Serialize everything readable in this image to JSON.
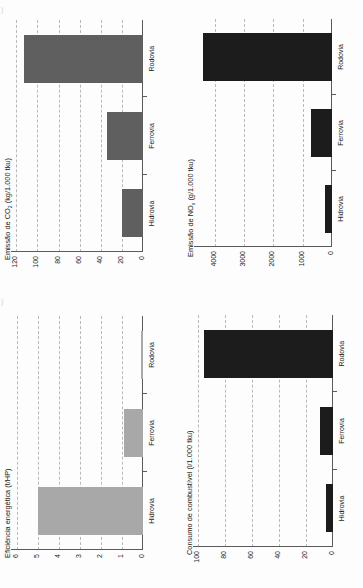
{
  "page": {
    "background": "#fdfdfd",
    "orientation": "rotated-90-ccw",
    "marks": {
      "top_left": ")",
      "mid_left": ")"
    }
  },
  "categories": [
    "Hidrovia",
    "Ferrovia",
    "Rodovia"
  ],
  "colors": {
    "bar_dark_gray": "#5f5f5f",
    "bar_light_gray": "#a8a8a8",
    "bar_black": "#1c1c1c",
    "grid": "#b9b9b9",
    "axis": "#5a5a5a",
    "text": "#1a1a1a"
  },
  "chart_data": [
    {
      "id": "co2",
      "type": "bar",
      "orientation": "vertical",
      "title": "Emissão de CO",
      "title_sub": "2",
      "title_tail": " (kg/1.000 tku)",
      "title_full": "Emissão de CO2 (kg/1.000 tku)",
      "xlabel": "",
      "ylabel": "Emissão de CO2 (kg/1.000 tku)",
      "categories": [
        "Hidrovia",
        "Ferrovia",
        "Rodovia"
      ],
      "values": [
        20,
        34,
        113
      ],
      "ticks": [
        0,
        20,
        40,
        60,
        80,
        100,
        120
      ],
      "tick_labels": [
        "0",
        "20",
        "40",
        "60",
        "80",
        "100",
        "120"
      ],
      "ylim": [
        0,
        125
      ],
      "grid": true,
      "legend": "none",
      "color": "#5f5f5f"
    },
    {
      "id": "nox",
      "type": "bar",
      "orientation": "vertical",
      "title": "Emissão de NO",
      "title_sub": "x",
      "title_tail": " (g/1.000 tku)",
      "title_full": "Emissão de NOx (g/1.000 tku)",
      "xlabel": "",
      "ylabel": "Emissão de NOx (g/1.000 tku)",
      "categories": [
        "Hidrovia",
        "Ferrovia",
        "Rodovia"
      ],
      "values": [
        240,
        700,
        4400
      ],
      "ticks": [
        0,
        1000,
        2000,
        3000,
        4000
      ],
      "tick_labels": [
        "0",
        "1000",
        "2000",
        "3000",
        "4000"
      ],
      "ylim": [
        0,
        4700
      ],
      "grid": true,
      "legend": "none",
      "color": "#1c1c1c"
    },
    {
      "id": "eficiencia",
      "type": "bar",
      "orientation": "vertical",
      "title": "Eficiência energética (t/HP)",
      "title_sub": "",
      "title_tail": "",
      "title_full": "Eficiência energética (t/HP)",
      "xlabel": "",
      "ylabel": "Eficiência energética (t/HP)",
      "categories": [
        "Hidrovia",
        "Ferrovia",
        "Rodovia"
      ],
      "values": [
        5.0,
        0.9,
        0.12
      ],
      "ticks": [
        0,
        1,
        2,
        3,
        4,
        5,
        6
      ],
      "tick_labels": [
        "0",
        "1",
        "2",
        "3",
        "4",
        "5",
        "6"
      ],
      "ylim": [
        0,
        6.3
      ],
      "grid": true,
      "legend": "none",
      "color": "#a8a8a8"
    },
    {
      "id": "combustivel",
      "type": "bar",
      "orientation": "vertical",
      "title": "Consumo de combustível (l/1.000 tku)",
      "title_sub": "",
      "title_tail": "",
      "title_full": "Consumo de combustível (l/1.000 tku)",
      "xlabel": "",
      "ylabel": "Consumo de combustível (l/1.000 tku)",
      "categories": [
        "Hidrovia",
        "Ferrovia",
        "Rodovia"
      ],
      "values": [
        5,
        10,
        96
      ],
      "ticks": [
        0,
        20,
        40,
        60,
        80,
        100
      ],
      "tick_labels": [
        "0",
        "20",
        "40",
        "60",
        "80",
        "100"
      ],
      "ylim": [
        0,
        104
      ],
      "grid": true,
      "legend": "none",
      "color": "#1c1c1c"
    }
  ]
}
